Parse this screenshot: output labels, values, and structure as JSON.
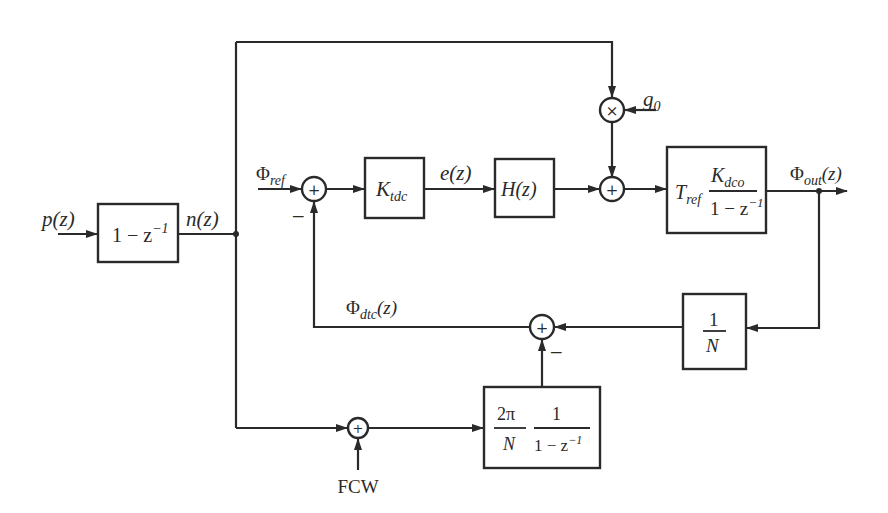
{
  "diagram": {
    "type": "block-diagram",
    "colors": {
      "stroke": "#2a2a2a",
      "background": "#ffffff"
    },
    "blocks": [
      {
        "id": "diff",
        "main": "1 − z",
        "sup": "−1"
      },
      {
        "id": "ktdc",
        "main": "K",
        "sub": "tdc"
      },
      {
        "id": "hz",
        "main": "H(z)"
      },
      {
        "id": "dco",
        "prefix": "T",
        "prefix_sub": "ref",
        "num": "K",
        "num_sub": "dco",
        "den": "1 − z",
        "den_sup": "−1"
      },
      {
        "id": "divn",
        "num": "1",
        "den": "N"
      },
      {
        "id": "integ",
        "num1": "2π",
        "den1": "N",
        "num2": "1",
        "den2": "1 − z",
        "den2_sup": "−1"
      }
    ],
    "junctions": [
      {
        "id": "sum_ref",
        "symbol": "+",
        "minus_label": "−"
      },
      {
        "id": "mult_g0",
        "symbol": "×"
      },
      {
        "id": "sum_dco_in",
        "symbol": "+"
      },
      {
        "id": "sum_dtc",
        "symbol": "+",
        "minus_label": "−"
      },
      {
        "id": "sum_fcw",
        "symbol": "+"
      }
    ],
    "signals": {
      "p": {
        "main": "p(z)"
      },
      "n": {
        "main": "n(z)"
      },
      "phi_ref": {
        "main": "Φ",
        "sub": "ref"
      },
      "e": {
        "main": "e(z)"
      },
      "g0": {
        "main": "g",
        "sub": "0"
      },
      "phi_out": {
        "main": "Φ",
        "sub": "out",
        "tail": "(z)"
      },
      "phi_dtc": {
        "main": "Φ",
        "sub": "dtc",
        "tail": "(z)"
      },
      "fcw": {
        "main": "FCW"
      }
    }
  }
}
